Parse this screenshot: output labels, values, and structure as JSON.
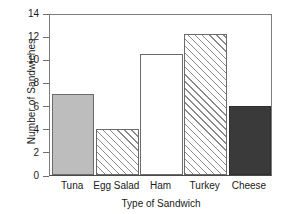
{
  "chart_data": {
    "type": "bar",
    "title": "",
    "xlabel": "Type of Sandwich",
    "ylabel": "Number of Sandwiches",
    "categories": [
      "Tuna",
      "Egg Salad",
      "Ham",
      "Turkey",
      "Cheese"
    ],
    "values": [
      7,
      4,
      10.5,
      12.2,
      6
    ],
    "ylim": [
      0,
      14
    ],
    "yticks": [
      0,
      2,
      4,
      6,
      8,
      10,
      12,
      14
    ],
    "ytick_labels": [
      "0",
      "2",
      "4",
      "6",
      "8",
      "10",
      "12",
      "14"
    ],
    "grid": false,
    "legend": "none",
    "bar_styles": [
      "solid-gray",
      "hatch-diagonal",
      "white",
      "hatch-diagonal",
      "solid-dark"
    ],
    "colors": {
      "solid_gray": "#bdbdbd",
      "solid_dark": "#3a3a3a",
      "white": "#ffffff",
      "hatch_line": "#8a8a8a",
      "outline": "#6b6b6b",
      "axis": "#4a4a4a",
      "background": "#ffffff",
      "text": "#1a1a1a"
    }
  }
}
